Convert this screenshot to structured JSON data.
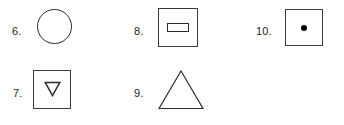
{
  "sheet": {
    "background_color": "#ffffff",
    "stroke_color": "#2b2b2b",
    "fill_color": "#000000"
  },
  "items": [
    {
      "number": "6.",
      "name": "circle",
      "shape": "circle",
      "filled": false,
      "contains": null
    },
    {
      "number": "7.",
      "name": "square-with-down-triangle",
      "shape": "square",
      "filled": false,
      "contains": "down-triangle-outline"
    },
    {
      "number": "8.",
      "name": "square-with-rectangle",
      "shape": "square",
      "filled": false,
      "contains": "horizontal-rectangle-outline"
    },
    {
      "number": "9.",
      "name": "triangle",
      "shape": "triangle",
      "filled": false,
      "contains": null
    },
    {
      "number": "10.",
      "name": "square-with-dot",
      "shape": "square",
      "filled": false,
      "contains": "filled-dot"
    }
  ]
}
